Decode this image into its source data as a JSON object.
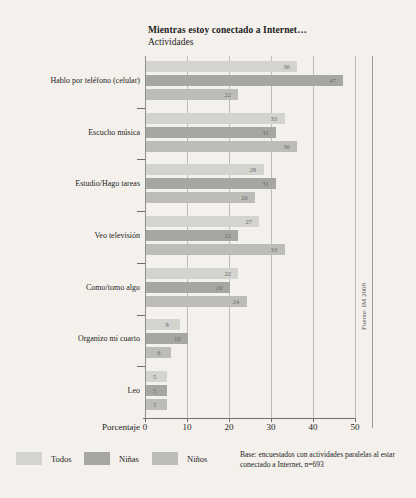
{
  "title": {
    "main": "Mientras estoy conectado a Internet…",
    "sub": "Actividades"
  },
  "axis": {
    "x_title": "Porcentaje",
    "x_ticks": [
      "0",
      "10",
      "20",
      "30",
      "40",
      "50"
    ]
  },
  "legend": [
    {
      "label": "Todos",
      "color": "#d3d3d0"
    },
    {
      "label": "Niñas",
      "color": "#a6a6a3"
    },
    {
      "label": "Niños",
      "color": "#bcbcb9"
    }
  ],
  "base_note": "Base: encuestados con actividades paralelas al estar conectado a Internet, n=693",
  "source": "Fuente: IM 2008",
  "chart_data": {
    "type": "bar",
    "title": "Mientras estoy conectado a Internet… Actividades",
    "xlabel": "Porcentaje",
    "ylabel": "",
    "xlim": [
      0,
      50
    ],
    "orientation": "horizontal",
    "grid": true,
    "legend_position": "bottom-left",
    "categories": [
      "Hablo por teléfono (celular)",
      "Escucho música",
      "Estudio/Hago tareas",
      "Veo televisión",
      "Como/tomo algo",
      "Organizo mi cuarto",
      "Leo"
    ],
    "series": [
      {
        "name": "Todos",
        "color": "#d3d3d0",
        "values": [
          36,
          33,
          28,
          27,
          22,
          8,
          5
        ]
      },
      {
        "name": "Niñas",
        "color": "#a6a6a3",
        "values": [
          47,
          31,
          31,
          22,
          20,
          10,
          5
        ]
      },
      {
        "name": "Niños",
        "color": "#bcbcb9",
        "values": [
          22,
          36,
          26,
          33,
          24,
          6,
          5
        ]
      }
    ]
  }
}
